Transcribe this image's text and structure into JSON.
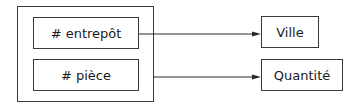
{
  "diagram": {
    "group": {
      "keys": [
        {
          "label": "# entrepôt"
        },
        {
          "label": "# pièce"
        }
      ]
    },
    "targets": [
      {
        "label": "Ville"
      },
      {
        "label": "Quantité"
      }
    ],
    "edges": [
      {
        "from": "group.keys.0",
        "to": "targets.0"
      },
      {
        "from": "group",
        "to": "targets.1"
      }
    ]
  }
}
